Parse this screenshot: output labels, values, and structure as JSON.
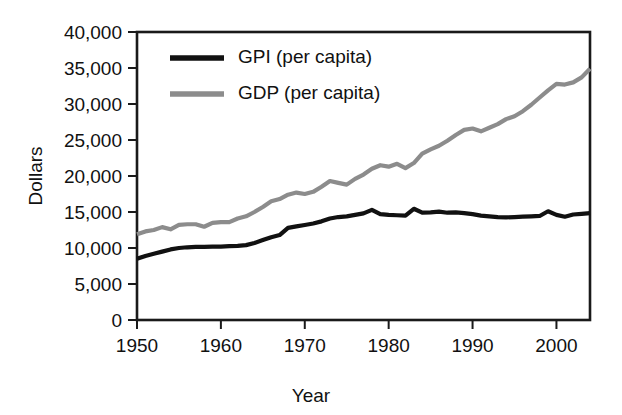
{
  "figure": {
    "background_color": "#ffffff",
    "axis_color": "#1a1a1a"
  },
  "axis": {
    "y_title": "Dollars",
    "x_title": "Year",
    "y_ticks": [
      "0",
      "5,000",
      "10,000",
      "15,000",
      "20,000",
      "25,000",
      "30,000",
      "35,000",
      "40,000"
    ],
    "x_ticks": [
      "1950",
      "1960",
      "1970",
      "1980",
      "1990",
      "2000"
    ]
  },
  "legend": {
    "entries": [
      {
        "label": "GPI (per capita)",
        "color": "#111111"
      },
      {
        "label": "GDP (per capita)",
        "color": "#8c8c8c"
      }
    ]
  },
  "chart_data": {
    "type": "line",
    "title": "",
    "subtitle": "",
    "xlabel": "Year",
    "ylabel": "Dollars",
    "xlim": [
      1950,
      2004
    ],
    "ylim": [
      0,
      40000
    ],
    "y_ticks": [
      0,
      5000,
      10000,
      15000,
      20000,
      25000,
      30000,
      35000,
      40000
    ],
    "x_ticks": [
      1950,
      1960,
      1970,
      1980,
      1990,
      2000
    ],
    "grid": false,
    "legend_position": "top-left",
    "x": [
      1950,
      1951,
      1952,
      1953,
      1954,
      1955,
      1956,
      1957,
      1958,
      1959,
      1960,
      1961,
      1962,
      1963,
      1964,
      1965,
      1966,
      1967,
      1968,
      1969,
      1970,
      1971,
      1972,
      1973,
      1974,
      1975,
      1976,
      1977,
      1978,
      1979,
      1980,
      1981,
      1982,
      1983,
      1984,
      1985,
      1986,
      1987,
      1988,
      1989,
      1990,
      1991,
      1992,
      1993,
      1994,
      1995,
      1996,
      1997,
      1998,
      1999,
      2000,
      2001,
      2002,
      2003,
      2004
    ],
    "series": [
      {
        "name": "GPI (per capita)",
        "color": "#111111",
        "width": 4.2,
        "values": [
          8500,
          8900,
          9200,
          9500,
          9800,
          10000,
          10100,
          10150,
          10150,
          10200,
          10200,
          10250,
          10300,
          10400,
          10700,
          11100,
          11500,
          11800,
          12800,
          13000,
          13200,
          13400,
          13700,
          14100,
          14300,
          14400,
          14600,
          14800,
          15300,
          14700,
          14600,
          14550,
          14500,
          15450,
          14900,
          14950,
          15050,
          14900,
          14950,
          14850,
          14700,
          14500,
          14400,
          14300,
          14250,
          14300,
          14350,
          14400,
          14450,
          15100,
          14600,
          14350,
          14650,
          14750,
          14850
        ]
      },
      {
        "name": "GDP (per capita)",
        "color": "#8c8c8c",
        "width": 4.2,
        "values": [
          11900,
          12300,
          12500,
          12900,
          12600,
          13200,
          13300,
          13300,
          12950,
          13500,
          13600,
          13600,
          14100,
          14400,
          15000,
          15700,
          16500,
          16800,
          17400,
          17700,
          17500,
          17800,
          18500,
          19300,
          19050,
          18800,
          19600,
          20200,
          21000,
          21500,
          21300,
          21700,
          21100,
          21800,
          23100,
          23700,
          24200,
          24900,
          25700,
          26400,
          26600,
          26200,
          26700,
          27200,
          27900,
          28300,
          29000,
          29900,
          30900,
          31900,
          32800,
          32700,
          33000,
          33700,
          34900
        ]
      }
    ]
  }
}
